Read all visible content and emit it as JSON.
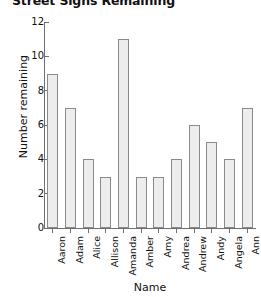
{
  "chart_data": {
    "type": "bar",
    "title": "Street Signs Remaining",
    "xlabel": "Name",
    "ylabel": "Number remaining",
    "categories": [
      "Aaron",
      "Adam",
      "Alice",
      "Allison",
      "Amanda",
      "Amber",
      "Amy",
      "Andrea",
      "Andrew",
      "Andy",
      "Angela",
      "Ann"
    ],
    "values": [
      9,
      7,
      4,
      3,
      11,
      3,
      3,
      4,
      6,
      5,
      4,
      7
    ],
    "ylim": [
      0,
      12
    ],
    "yticks": [
      0,
      2,
      4,
      6,
      8,
      10,
      12
    ],
    "ytick_labels": [
      "0",
      "2",
      "4",
      "6",
      "8",
      "10",
      "12"
    ],
    "grid": false,
    "legend": null,
    "bar_fill_color": "#ededed",
    "bar_edge_color": "#8a8a8a",
    "axis_color": "#6f6f6f",
    "text_color": "#111111"
  }
}
